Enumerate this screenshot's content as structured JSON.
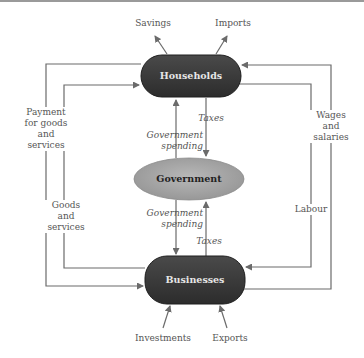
{
  "diagram": {
    "nodes": {
      "households": "Households",
      "government": "Government",
      "businesses": "Businesses"
    },
    "labels": {
      "savings": "Savings",
      "imports": "Imports",
      "investments": "Investments",
      "exports": "Exports",
      "payment_line1": "Payment",
      "payment_line2": "for goods",
      "payment_line3": "and",
      "payment_line4": "services",
      "goods_line1": "Goods",
      "goods_line2": "and",
      "goods_line3": "services",
      "wages_line1": "Wages",
      "wages_line2": "and",
      "wages_line3": "salaries",
      "labour": "Labour",
      "taxes_top": "Taxes",
      "taxes_bottom": "Taxes",
      "gov_spending_top_1": "Government",
      "gov_spending_top_2": "spending",
      "gov_spending_bottom_1": "Government",
      "gov_spending_bottom_2": "spending"
    },
    "colors": {
      "node_dark": "#3a3a3a",
      "node_gov": "#a8a8a8",
      "line": "#6b6b6b"
    }
  }
}
